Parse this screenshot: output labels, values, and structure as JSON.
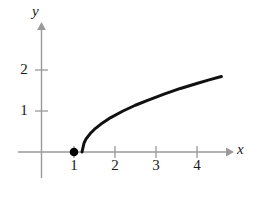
{
  "figure": {
    "background_color": "#ffffff",
    "axis_color": "#9a9a9a",
    "curve_color": "#111111",
    "point_color": "#000000",
    "width": 261,
    "height": 197
  },
  "axes": {
    "x_label": "x",
    "y_label": "y",
    "origin_px": [
      41,
      152
    ],
    "unit_px": 41,
    "x_ticks": [
      {
        "value": 1,
        "label": "1",
        "px": 74
      },
      {
        "value": 2,
        "label": "2",
        "px": 115
      },
      {
        "value": 3,
        "label": "3",
        "px": 156
      },
      {
        "value": 4,
        "label": "4",
        "px": 197
      }
    ],
    "y_ticks": [
      {
        "value": 1,
        "label": "1",
        "px": 111
      },
      {
        "value": 2,
        "label": "2",
        "px": 70
      }
    ]
  },
  "chart_data": {
    "type": "line",
    "title": "",
    "xlabel": "x",
    "ylabel": "y",
    "xlim": [
      -0.55,
      5.4
    ],
    "ylim": [
      -0.75,
      3.1
    ],
    "grid": false,
    "legend": null,
    "function": "y = sqrt(x - 1)",
    "domain": [
      1,
      4.4
    ],
    "x": [
      1,
      1.05,
      1.1,
      1.2,
      1.3,
      1.5,
      1.7,
      2,
      2.3,
      2.6,
      3,
      3.4,
      3.8,
      4.1,
      4.4
    ],
    "y": [
      0,
      0.22,
      0.32,
      0.45,
      0.55,
      0.71,
      0.84,
      1,
      1.14,
      1.26,
      1.41,
      1.55,
      1.67,
      1.76,
      1.84
    ],
    "markers": [
      {
        "name": "endpoint",
        "x": 1,
        "y": 0,
        "style": "filled-circle",
        "label": ""
      }
    ],
    "x_ticks": [
      1,
      2,
      3,
      4
    ],
    "y_ticks": [
      1,
      2
    ],
    "x_tick_labels": [
      "1",
      "2",
      "3",
      "4"
    ],
    "y_tick_labels": [
      "1",
      "2"
    ]
  }
}
